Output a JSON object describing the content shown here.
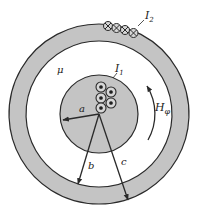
{
  "figure": {
    "colors": {
      "conductor_fill": "#c4c4c4",
      "stroke": "#2a2a2a",
      "background": "#ffffff"
    },
    "labels": {
      "I1": "I",
      "I1_sub": "1",
      "I2": "I",
      "I2_sub": "2",
      "mu": "μ",
      "H": "H",
      "H_sub": "φ",
      "a": "a",
      "b": "b",
      "c": "c"
    },
    "geometry": {
      "center": [
        99,
        114
      ],
      "inner_radius_a": 39,
      "shell_inner_radius_b": 73,
      "shell_outer_radius_c": 90
    },
    "current_symbols": {
      "inner_out_of_page_dots": 5,
      "outer_into_page_crosses": 4
    }
  }
}
